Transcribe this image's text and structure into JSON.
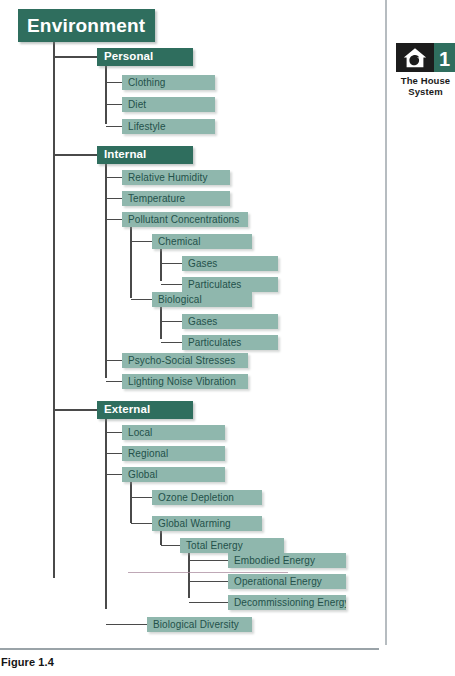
{
  "figure": {
    "caption": "Figure 1.4",
    "chapter_badge": {
      "number": "1",
      "title_line1": "The House",
      "title_line2": "System",
      "icon": "house-icon",
      "icon_panel_color": "#1c1c1c",
      "number_panel_color": "#2f6e5e"
    }
  },
  "palette": {
    "dark_green": "#2f6e5e",
    "light_green": "#8fb7ad",
    "leaf_text": "#23514a",
    "connector": "#4a4a4a",
    "rail": "#b6bcc0"
  },
  "diagram": {
    "type": "tree",
    "root": "Environment",
    "nodes": [
      {
        "id": "environment",
        "label": "Environment",
        "kind": "root",
        "x": 18,
        "y": 9,
        "w": 137,
        "h": 33,
        "parent": null,
        "trunk_to": 578
      },
      {
        "id": "personal",
        "label": "Personal",
        "kind": "head",
        "x": 97,
        "y": 48,
        "w": 96,
        "h": 18,
        "parent": "environment",
        "trunk_to": 124
      },
      {
        "id": "clothing",
        "label": "Clothing",
        "kind": "leaf",
        "x": 122,
        "y": 75,
        "w": 93,
        "h": 15,
        "parent": "personal"
      },
      {
        "id": "diet",
        "label": "Diet",
        "kind": "leaf",
        "x": 122,
        "y": 97,
        "w": 93,
        "h": 15,
        "parent": "personal"
      },
      {
        "id": "lifestyle",
        "label": "Lifestyle",
        "kind": "leaf",
        "x": 122,
        "y": 119,
        "w": 93,
        "h": 15,
        "parent": "personal"
      },
      {
        "id": "internal",
        "label": "Internal",
        "kind": "head",
        "x": 97,
        "y": 146,
        "w": 96,
        "h": 18,
        "parent": "environment",
        "trunk_to": 378
      },
      {
        "id": "rel-humidity",
        "label": "Relative Humidity",
        "kind": "leaf",
        "x": 122,
        "y": 170,
        "w": 108,
        "h": 15,
        "parent": "internal"
      },
      {
        "id": "temperature",
        "label": "Temperature",
        "kind": "leaf",
        "x": 122,
        "y": 191,
        "w": 108,
        "h": 15,
        "parent": "internal"
      },
      {
        "id": "pollutant",
        "label": "Pollutant Concentrations",
        "kind": "leaf",
        "x": 122,
        "y": 212,
        "w": 126,
        "h": 15,
        "parent": "internal",
        "trunk_to": 298
      },
      {
        "id": "chemical",
        "label": "Chemical",
        "kind": "leaf",
        "x": 152,
        "y": 234,
        "w": 100,
        "h": 15,
        "parent": "pollutant",
        "trunk_to": 281
      },
      {
        "id": "chem-gases",
        "label": "Gases",
        "kind": "leaf",
        "x": 182,
        "y": 256,
        "w": 96,
        "h": 15,
        "parent": "chemical"
      },
      {
        "id": "chem-part",
        "label": "Particulates",
        "kind": "leaf",
        "x": 182,
        "y": 277,
        "w": 96,
        "h": 15,
        "parent": "chemical"
      },
      {
        "id": "biological",
        "label": "Biological",
        "kind": "leaf",
        "x": 152,
        "y": 292,
        "w": 100,
        "h": 15,
        "parent": "pollutant",
        "trunk_to": 339
      },
      {
        "id": "bio-gases",
        "label": "Gases",
        "kind": "leaf",
        "x": 182,
        "y": 314,
        "w": 96,
        "h": 15,
        "parent": "biological"
      },
      {
        "id": "bio-part",
        "label": "Particulates",
        "kind": "leaf",
        "x": 182,
        "y": 335,
        "w": 96,
        "h": 15,
        "parent": "biological"
      },
      {
        "id": "psycho",
        "label": "Psycho-Social Stresses",
        "kind": "leaf",
        "x": 122,
        "y": 353,
        "w": 126,
        "h": 15,
        "parent": "internal"
      },
      {
        "id": "lighting",
        "label": "Lighting Noise Vibration",
        "kind": "leaf",
        "x": 122,
        "y": 374,
        "w": 126,
        "h": 15,
        "parent": "internal"
      },
      {
        "id": "external",
        "label": "External",
        "kind": "head",
        "x": 97,
        "y": 401,
        "w": 96,
        "h": 18,
        "parent": "environment",
        "trunk_to": 609
      },
      {
        "id": "local",
        "label": "Local",
        "kind": "leaf",
        "x": 122,
        "y": 425,
        "w": 103,
        "h": 15,
        "parent": "external"
      },
      {
        "id": "regional",
        "label": "Regional",
        "kind": "leaf",
        "x": 122,
        "y": 446,
        "w": 103,
        "h": 15,
        "parent": "external"
      },
      {
        "id": "global",
        "label": "Global",
        "kind": "leaf",
        "x": 122,
        "y": 467,
        "w": 103,
        "h": 15,
        "parent": "external",
        "trunk_to": 523
      },
      {
        "id": "ozone",
        "label": "Ozone Depletion",
        "kind": "leaf",
        "x": 152,
        "y": 490,
        "w": 110,
        "h": 15,
        "parent": "global"
      },
      {
        "id": "warming",
        "label": "Global Warming",
        "kind": "leaf",
        "x": 152,
        "y": 516,
        "w": 110,
        "h": 15,
        "parent": "global",
        "trunk_to": 545
      },
      {
        "id": "total-energy",
        "label": "Total Energy",
        "kind": "leaf",
        "x": 180,
        "y": 538,
        "w": 104,
        "h": 15,
        "parent": "warming",
        "trunk_to": 598
      },
      {
        "id": "embodied",
        "label": "Embodied Energy",
        "kind": "leaf",
        "x": 228,
        "y": 553,
        "w": 118,
        "h": 15,
        "parent": "total-energy"
      },
      {
        "id": "operational",
        "label": "Operational Energy",
        "kind": "leaf",
        "x": 228,
        "y": 574,
        "w": 118,
        "h": 15,
        "parent": "total-energy"
      },
      {
        "id": "decommission",
        "label": "Decommissioning Energy",
        "kind": "leaf",
        "x": 228,
        "y": 595,
        "w": 118,
        "h": 15,
        "parent": "total-energy"
      },
      {
        "id": "bio-diversity",
        "label": "Biological Diversity",
        "kind": "leaf",
        "x": 147,
        "y": 617,
        "w": 105,
        "h": 15,
        "parent": "external"
      }
    ]
  }
}
